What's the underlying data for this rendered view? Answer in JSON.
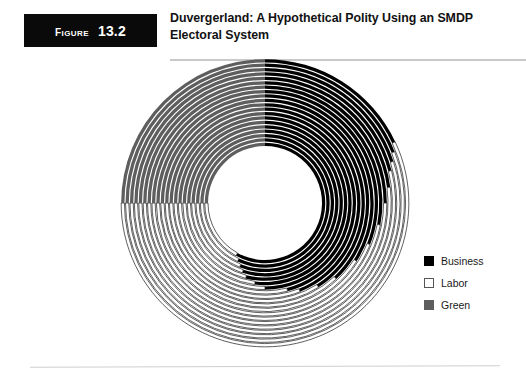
{
  "figure": {
    "tag_word": "Figure",
    "tag_number": "13.2",
    "title": "Duvergerland: A Hypothetical Polity Using an SMDP Electoral System"
  },
  "legend": {
    "items": [
      {
        "label": "Business",
        "color": "#000000",
        "swatch": "filled"
      },
      {
        "label": "Labor",
        "color": "#ffffff",
        "swatch": "outlined"
      },
      {
        "label": "Green",
        "color": "#5e5e5e",
        "swatch": "filled"
      }
    ]
  },
  "chart_data": {
    "type": "pie",
    "variant": "concentric-rings",
    "title": "Duvergerland: A Hypothetical Polity Using an SMDP Electoral System",
    "series_names": [
      "Business",
      "Labor",
      "Green"
    ],
    "series_colors": [
      "#000000",
      "#ffffff",
      "#5e5e5e"
    ],
    "start_angle_deg": 0,
    "direction": "clockwise",
    "center": [
      147,
      147
    ],
    "outer_radius": 145,
    "inner_radius": 57,
    "ring_count": 20,
    "units": "percent",
    "categories": [
      "District 1",
      "District 2",
      "District 3",
      "District 4",
      "District 5",
      "District 6",
      "District 7",
      "District 8",
      "District 9",
      "District 10",
      "District 11",
      "District 12",
      "District 13",
      "District 14",
      "District 15",
      "District 16",
      "District 17",
      "District 18",
      "District 19",
      "District 20"
    ],
    "rings": [
      {
        "district": "District 1",
        "business": 58,
        "labor": 17,
        "green": 25
      },
      {
        "district": "District 2",
        "business": 57,
        "labor": 18,
        "green": 25
      },
      {
        "district": "District 3",
        "business": 56,
        "labor": 19,
        "green": 25
      },
      {
        "district": "District 4",
        "business": 55,
        "labor": 20,
        "green": 25
      },
      {
        "district": "District 5",
        "business": 54,
        "labor": 21,
        "green": 25
      },
      {
        "district": "District 6",
        "business": 52,
        "labor": 23,
        "green": 25
      },
      {
        "district": "District 7",
        "business": 50,
        "labor": 25,
        "green": 25
      },
      {
        "district": "District 8",
        "business": 46,
        "labor": 29,
        "green": 25
      },
      {
        "district": "District 9",
        "business": 44,
        "labor": 31,
        "green": 25
      },
      {
        "district": "District 10",
        "business": 41,
        "labor": 34,
        "green": 25
      },
      {
        "district": "District 11",
        "business": 38,
        "labor": 37,
        "green": 25
      },
      {
        "district": "District 12",
        "business": 34,
        "labor": 41,
        "green": 25
      },
      {
        "district": "District 13",
        "business": 31,
        "labor": 44,
        "green": 25
      },
      {
        "district": "District 14",
        "business": 28,
        "labor": 47,
        "green": 25
      },
      {
        "district": "District 15",
        "business": 25,
        "labor": 50,
        "green": 25
      },
      {
        "district": "District 16",
        "business": 23,
        "labor": 52,
        "green": 25
      },
      {
        "district": "District 17",
        "business": 21,
        "labor": 54,
        "green": 25
      },
      {
        "district": "District 18",
        "business": 20,
        "labor": 55,
        "green": 25
      },
      {
        "district": "District 19",
        "business": 19,
        "labor": 56,
        "green": 25
      },
      {
        "district": "District 20",
        "business": 18,
        "labor": 57,
        "green": 25
      }
    ],
    "totals": {
      "business": 25,
      "labor": 50,
      "green": 25
    },
    "legend_position": "right",
    "grid": false
  }
}
